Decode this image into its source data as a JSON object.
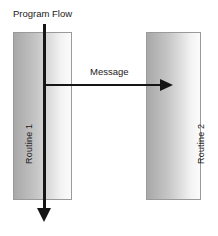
{
  "diagram": {
    "type": "uml-sequence-diagram",
    "title": "",
    "background_color": "#ffffff",
    "line_color": "#151515",
    "box_border_color": "#9a9a9a",
    "box_shadow_color": "#6e6e6e",
    "box_gradient_from": "#a8a8a8",
    "box_gradient_to": "#fbfbfb",
    "lifelines": [
      {
        "id": "routine-1",
        "label": "Routine 1",
        "orientation": "vertical-rotated-ccw"
      },
      {
        "id": "routine-2",
        "label": "Routine 2",
        "orientation": "vertical-rotated-ccw"
      }
    ],
    "arrows": [
      {
        "id": "program-flow",
        "label": "Program Flow",
        "direction": "down",
        "from": "top",
        "to": "below-routine-1"
      },
      {
        "id": "message",
        "label": "Message",
        "direction": "right",
        "from": "routine-1",
        "to": "routine-2"
      }
    ]
  }
}
